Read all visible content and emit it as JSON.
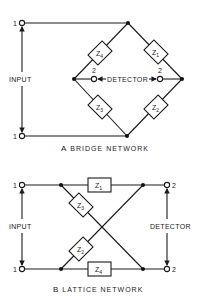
{
  "colors": {
    "ink": "#1a1a1a",
    "background": "#ffffff"
  },
  "bridge": {
    "caption_letter": "A",
    "caption": "BRIDGE NETWORK",
    "input_label": "INPUT",
    "detector_label": "DETECTOR",
    "input_terminal_top": "1",
    "input_terminal_bottom": "1",
    "detector_terminal_left": "2",
    "detector_terminal_right": "2",
    "impedances": [
      {
        "id": "Z4",
        "base": "Z",
        "sub": "4"
      },
      {
        "id": "Z1",
        "base": "Z",
        "sub": "1"
      },
      {
        "id": "Z3",
        "base": "Z",
        "sub": "3"
      },
      {
        "id": "Z2",
        "base": "Z",
        "sub": "2"
      }
    ]
  },
  "lattice": {
    "caption_letter": "B",
    "caption": "LATTICE NETWORK",
    "input_label": "INPUT",
    "detector_label": "DETECTOR",
    "input_terminal_top": "1",
    "input_terminal_bottom": "1",
    "detector_terminal_top": "2",
    "detector_terminal_bottom": "2",
    "impedances": [
      {
        "id": "Z1",
        "base": "Z",
        "sub": "1"
      },
      {
        "id": "Z3",
        "base": "Z",
        "sub": "3"
      },
      {
        "id": "Z2",
        "base": "Z",
        "sub": "2"
      },
      {
        "id": "Z4",
        "base": "Z",
        "sub": "4"
      }
    ]
  }
}
